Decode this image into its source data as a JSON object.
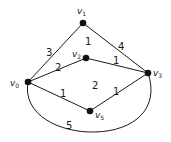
{
  "graph": {
    "vertices": [
      {
        "id": "v0",
        "label": "v",
        "sub": "0"
      },
      {
        "id": "v1",
        "label": "v",
        "sub": "1"
      },
      {
        "id": "v2",
        "label": "v",
        "sub": "2"
      },
      {
        "id": "v3",
        "label": "v",
        "sub": "3"
      },
      {
        "id": "v5",
        "label": "v",
        "sub": "5"
      }
    ],
    "edges": [
      {
        "from": "v0",
        "to": "v1",
        "weight": "3"
      },
      {
        "from": "v1",
        "to": "v3",
        "weight": "4"
      },
      {
        "from": "v0",
        "to": "v2",
        "weight": "2"
      },
      {
        "from": "v2",
        "to": "v3",
        "weight": "1"
      },
      {
        "from": "v0",
        "to": "v5",
        "weight": "1"
      },
      {
        "from": "v5",
        "to": "v3",
        "weight": "1"
      },
      {
        "from": "v0",
        "to": "v3",
        "weight": "5",
        "curved": true
      }
    ],
    "faces": [
      {
        "region": "v0-v1-v3-v2",
        "label": "1"
      },
      {
        "region": "v0-v2-v3-v5",
        "label": "2"
      }
    ]
  }
}
